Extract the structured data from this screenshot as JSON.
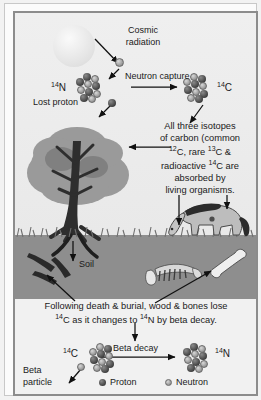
{
  "diagram": {
    "labels": {
      "cosmic_radiation_l1": "Cosmic",
      "cosmic_radiation_l2": "radiation",
      "neutron_capture": "Neutron capture",
      "nitrogen14": "14N",
      "carbon14_top": "14C",
      "lost_proton": "Lost proton",
      "soil": "Soil",
      "beta_decay": "Beta decay",
      "carbon14_bottom": "14C",
      "nitrogen14_bottom": "14N",
      "beta_particle_l1": "Beta",
      "beta_particle_l2": "particle",
      "legend_proton": "Proton",
      "legend_neutron": "Neutron"
    },
    "isotope_superscripts": {
      "n14": "14",
      "n14_sym": "N",
      "c14": "14",
      "c14_sym": "C",
      "c12": "12",
      "c12_sym": "C",
      "c13": "13",
      "c13_sym": "C"
    },
    "absorption_note": {
      "line1": "All three isotopes",
      "line2": "of carbon (common",
      "line3_pre": "",
      "line3_sup1": "12",
      "line3_a": "C, rare ",
      "line3_sup2": "13",
      "line3_b": "C &",
      "line4_pre": "radioactive ",
      "line4_sup": "14",
      "line4_post": "C are",
      "line5": "absorbed by",
      "line6": "living organisms."
    },
    "decay_note": {
      "line1": "Following death & burial, wood & bones lose",
      "line2_sup1": "14",
      "line2_a": "C as it changes to ",
      "line2_sup2": "14",
      "line2_b": "N by beta decay."
    },
    "scene": {
      "sun": "sun",
      "tree": "tree",
      "horse": "grazing-horse",
      "buried_wood": "buried-wood",
      "buried_skeleton": "buried-skeleton",
      "buried_bone": "buried-bone"
    }
  },
  "colors": {
    "frame": "#8c8c8c",
    "sky": "#ececec",
    "ground": "#8e8e8e",
    "tree_canopy": "#9a9a9a",
    "tree_trunk": "#2e2e2e",
    "horse_body": "#bdbdbd",
    "proton": "#3b3b3b",
    "neutron": "#9c9c9c",
    "text": "#1a1a1a"
  }
}
